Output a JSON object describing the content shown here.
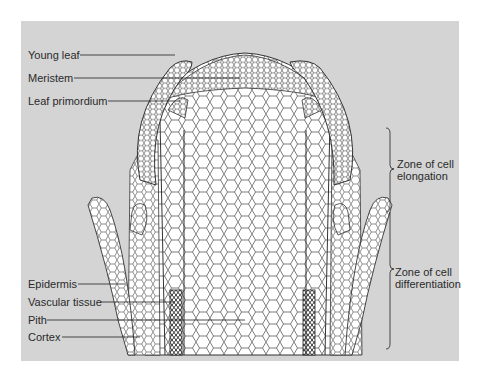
{
  "diagram": {
    "colors": {
      "background_panel": "#d4d4d4",
      "cell_fill": "#ffffff",
      "cell_stroke": "#333333",
      "label_text": "#2a2a2a"
    },
    "left_labels_top": [
      {
        "id": "young-leaf",
        "text": "Young leaf"
      },
      {
        "id": "meristem",
        "text": "Meristem"
      },
      {
        "id": "leaf-primordium",
        "text": "Leaf primordium"
      }
    ],
    "left_labels_bottom": [
      {
        "id": "epidermis",
        "text": "Epidermis"
      },
      {
        "id": "vascular-tissue",
        "text": "Vascular tissue"
      },
      {
        "id": "pith",
        "text": "Pith"
      },
      {
        "id": "cortex",
        "text": "Cortex"
      }
    ],
    "zones": [
      {
        "id": "elongation",
        "line1": "Zone of cell",
        "line2": "elongation"
      },
      {
        "id": "differentiation",
        "line1": "Zone of cell",
        "line2": "differentiation"
      }
    ]
  }
}
